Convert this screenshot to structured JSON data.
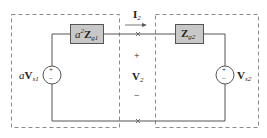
{
  "diagram": {
    "type": "circuit",
    "left_network": {
      "source_label_prefix": "a",
      "source_label_main": "V",
      "source_label_sub": "s1",
      "source_polarity_plus": "+",
      "source_polarity_minus": "−",
      "impedance_prefix": "a",
      "impedance_power": "2",
      "impedance_main": "Z",
      "impedance_sub": "g1"
    },
    "right_network": {
      "source_label_main": "V",
      "source_label_sub": "s2",
      "source_polarity_plus": "+",
      "source_polarity_minus": "−",
      "impedance_main": "Z",
      "impedance_sub": "g2"
    },
    "port": {
      "current_main": "I",
      "current_sub": "2",
      "voltage_main": "V",
      "voltage_sub": "2",
      "voltage_plus": "+",
      "voltage_minus": "−",
      "terminal_marker": "×"
    },
    "colors": {
      "wire": "#555555",
      "dashed_box": "#888888",
      "impedance_fill": "#c8c8c8",
      "impedance_stroke": "#555555",
      "text": "#222222"
    }
  }
}
